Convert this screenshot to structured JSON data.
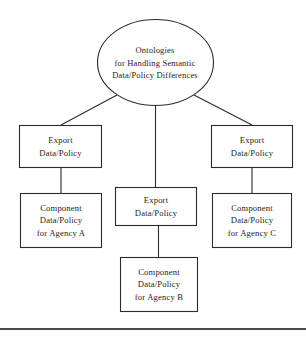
{
  "figure": {
    "type": "hierarchy-diagram",
    "title": "Ontologies for Handling Semantic Data/Policy Differences",
    "background_color": "#ffffff",
    "stroke_color": "#2b2b2b",
    "text_color": "#1d1d1d"
  },
  "nodes": {
    "root": {
      "shape": "ellipse",
      "line1": "Ontologies",
      "line2": "for Handling Semantic",
      "line3": "Data/Policy Differences"
    },
    "export_left": {
      "shape": "rectangle",
      "line1": "Export",
      "line2": "Data/Policy"
    },
    "export_center": {
      "shape": "rectangle",
      "line1": "Export",
      "line2": "Data/Policy"
    },
    "export_right": {
      "shape": "rectangle",
      "line1": "Export",
      "line2": "Data/Policy"
    },
    "agency_a": {
      "shape": "rectangle",
      "line1": "Component",
      "line2": "Data/Policy",
      "line3": "for Agency A"
    },
    "agency_b": {
      "shape": "rectangle",
      "line1": "Component",
      "line2": "Data/Policy",
      "line3": "for Agency B"
    },
    "agency_c": {
      "shape": "rectangle",
      "line1": "Component",
      "line2": "Data/Policy",
      "line3": "for Agency C"
    }
  },
  "edges": [
    {
      "name": "root-to-export-left",
      "from": "root",
      "to": "export_left",
      "style": "diagonal"
    },
    {
      "name": "root-to-export-center",
      "from": "root",
      "to": "export_center",
      "style": "vertical"
    },
    {
      "name": "root-to-export-right",
      "from": "root",
      "to": "export_right",
      "style": "diagonal"
    },
    {
      "name": "export-left-to-agency-a",
      "from": "export_left",
      "to": "agency_a",
      "style": "vertical"
    },
    {
      "name": "export-center-to-agency-b",
      "from": "export_center",
      "to": "agency_b",
      "style": "vertical"
    },
    {
      "name": "export-right-to-agency-c",
      "from": "export_right",
      "to": "agency_c",
      "style": "vertical"
    }
  ]
}
